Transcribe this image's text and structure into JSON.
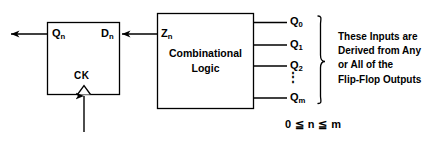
{
  "diagram": {
    "flip_flop": {
      "name": "flip-flop",
      "output_label": "Q",
      "output_subscript": "n",
      "input_label": "D",
      "input_subscript": "n",
      "clock_label": "CK"
    },
    "logic_block": {
      "name": "combinational-logic",
      "line1": "Combinational",
      "line2": "Logic",
      "input_label": "Z",
      "input_subscript": "n"
    },
    "logic_inputs": [
      {
        "label": "Q",
        "subscript": "0"
      },
      {
        "label": "Q",
        "subscript": "1"
      },
      {
        "label": "Q",
        "subscript": "2"
      },
      {
        "label": "Q",
        "subscript": "m"
      }
    ],
    "ellipsis": "⋮",
    "annotation": {
      "line1": "These Inputs are",
      "line2": "Derived from Any",
      "line3": "or All of the",
      "line4": "Flip-Flop Outputs"
    },
    "constraint": "0 ≦ n ≦ m",
    "colors": {
      "stroke": "#000000",
      "background": "#ffffff",
      "text": "#000000"
    }
  }
}
